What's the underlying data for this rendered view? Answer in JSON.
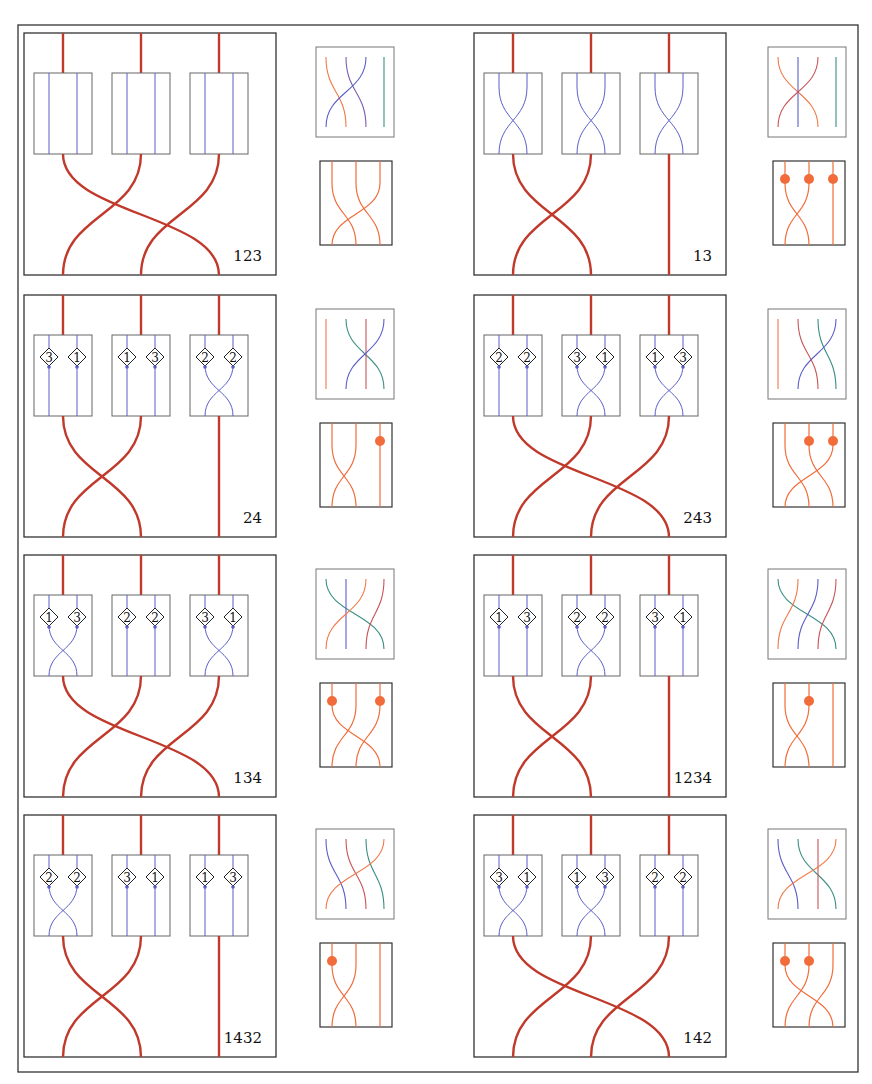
{
  "figure": {
    "width": 872,
    "height": 1084,
    "outer_frame": {
      "x": 18,
      "y": 25,
      "w": 840,
      "h": 1047
    },
    "colors": {
      "frame": "#333333",
      "thick_strand": "#c0392b",
      "blue_strand": "#5b5fc7",
      "orange_strand": "#f26b3a",
      "teal_strand": "#2e8b7a",
      "red_strand": "#d9534f",
      "dot": "#f26b3a",
      "box_border": "#555555"
    }
  },
  "panels": [
    {
      "label": "123",
      "col": 0,
      "row": 0,
      "top_perm": [
        [
          0,
          2
        ],
        [
          1,
          0
        ],
        [
          2,
          1
        ]
      ],
      "boxes": [
        {
          "type": "plain",
          "badges": null,
          "cross": false
        },
        {
          "type": "plain",
          "badges": null,
          "cross": false
        },
        {
          "type": "plain",
          "badges": null,
          "cross": false
        }
      ],
      "small_top": {
        "strands": [
          [
            "orange",
            0,
            1
          ],
          [
            "purple",
            1,
            2
          ],
          [
            "blue",
            2,
            0
          ],
          [
            "teal",
            3,
            3
          ]
        ]
      },
      "small_bottom": {
        "dots": [],
        "perm": [
          [
            0,
            1
          ],
          [
            1,
            2
          ],
          [
            2,
            0
          ]
        ]
      }
    },
    {
      "label": "13",
      "col": 1,
      "row": 0,
      "top_perm": [
        [
          0,
          1
        ],
        [
          1,
          0
        ],
        [
          2,
          2
        ]
      ],
      "boxes": [
        {
          "type": "cross",
          "badges": null
        },
        {
          "type": "cross",
          "badges": null
        },
        {
          "type": "cross",
          "badges": null
        }
      ],
      "small_top": {
        "strands": [
          [
            "orange",
            0,
            2
          ],
          [
            "blue",
            1,
            1
          ],
          [
            "red",
            2,
            0
          ],
          [
            "teal",
            3,
            3
          ]
        ]
      },
      "small_bottom": {
        "dots": [
          0,
          1,
          2
        ],
        "perm": [
          [
            0,
            1
          ],
          [
            1,
            0
          ],
          [
            2,
            2
          ]
        ]
      }
    },
    {
      "label": "24",
      "col": 0,
      "row": 1,
      "top_perm": [
        [
          0,
          1
        ],
        [
          1,
          0
        ],
        [
          2,
          2
        ]
      ],
      "boxes": [
        {
          "type": "plain",
          "badges": [
            "3",
            "1"
          ]
        },
        {
          "type": "plain",
          "badges": [
            "1",
            "3"
          ]
        },
        {
          "type": "cross",
          "badges": [
            "2",
            "2"
          ]
        }
      ],
      "small_top": {
        "strands": [
          [
            "orange",
            0,
            0
          ],
          [
            "teal",
            1,
            3
          ],
          [
            "red",
            2,
            2
          ],
          [
            "blue",
            3,
            1
          ]
        ]
      },
      "small_bottom": {
        "dots": [
          2
        ],
        "perm": [
          [
            0,
            1
          ],
          [
            1,
            0
          ],
          [
            2,
            2
          ]
        ]
      }
    },
    {
      "label": "243",
      "col": 1,
      "row": 1,
      "top_perm": [
        [
          0,
          2
        ],
        [
          1,
          0
        ],
        [
          2,
          1
        ]
      ],
      "boxes": [
        {
          "type": "plain",
          "badges": [
            "2",
            "2"
          ]
        },
        {
          "type": "cross",
          "badges": [
            "3",
            "1"
          ]
        },
        {
          "type": "cross",
          "badges": [
            "1",
            "3"
          ]
        }
      ],
      "small_top": {
        "strands": [
          [
            "orange",
            0,
            0
          ],
          [
            "red",
            1,
            2
          ],
          [
            "teal",
            2,
            3
          ],
          [
            "blue",
            3,
            1
          ]
        ]
      },
      "small_bottom": {
        "dots": [
          1,
          2
        ],
        "perm": [
          [
            0,
            1
          ],
          [
            1,
            2
          ],
          [
            2,
            0
          ]
        ]
      }
    },
    {
      "label": "134",
      "col": 0,
      "row": 2,
      "top_perm": [
        [
          0,
          2
        ],
        [
          1,
          0
        ],
        [
          2,
          1
        ]
      ],
      "boxes": [
        {
          "type": "cross",
          "badges": [
            "1",
            "3"
          ]
        },
        {
          "type": "plain",
          "badges": [
            "2",
            "2"
          ]
        },
        {
          "type": "cross",
          "badges": [
            "3",
            "1"
          ]
        }
      ],
      "small_top": {
        "strands": [
          [
            "teal",
            0,
            3
          ],
          [
            "blue",
            1,
            1
          ],
          [
            "orange",
            2,
            0
          ],
          [
            "red",
            3,
            2
          ]
        ]
      },
      "small_bottom": {
        "dots": [
          0,
          2
        ],
        "perm": [
          [
            0,
            2
          ],
          [
            1,
            0
          ],
          [
            2,
            1
          ]
        ]
      }
    },
    {
      "label": "1234",
      "col": 1,
      "row": 2,
      "top_perm": [
        [
          0,
          1
        ],
        [
          1,
          0
        ],
        [
          2,
          2
        ]
      ],
      "boxes": [
        {
          "type": "plain",
          "badges": [
            "1",
            "3"
          ]
        },
        {
          "type": "cross",
          "badges": [
            "2",
            "2"
          ]
        },
        {
          "type": "plain",
          "badges": [
            "3",
            "1"
          ]
        }
      ],
      "small_top": {
        "strands": [
          [
            "teal",
            0,
            3
          ],
          [
            "orange",
            1,
            0
          ],
          [
            "blue",
            2,
            1
          ],
          [
            "red",
            3,
            2
          ]
        ]
      },
      "small_bottom": {
        "dots": [
          1
        ],
        "perm": [
          [
            0,
            1
          ],
          [
            1,
            0
          ],
          [
            2,
            2
          ]
        ]
      }
    },
    {
      "label": "1432",
      "col": 0,
      "row": 3,
      "top_perm": [
        [
          0,
          1
        ],
        [
          1,
          0
        ],
        [
          2,
          2
        ]
      ],
      "boxes": [
        {
          "type": "cross",
          "badges": [
            "2",
            "2"
          ]
        },
        {
          "type": "plain",
          "badges": [
            "3",
            "1"
          ]
        },
        {
          "type": "plain",
          "badges": [
            "1",
            "3"
          ]
        }
      ],
      "small_top": {
        "strands": [
          [
            "blue",
            0,
            1
          ],
          [
            "red",
            1,
            2
          ],
          [
            "teal",
            2,
            3
          ],
          [
            "orange",
            3,
            0
          ]
        ]
      },
      "small_bottom": {
        "dots": [
          0
        ],
        "perm": [
          [
            0,
            1
          ],
          [
            1,
            0
          ],
          [
            2,
            2
          ]
        ]
      }
    },
    {
      "label": "142",
      "col": 1,
      "row": 3,
      "top_perm": [
        [
          0,
          2
        ],
        [
          1,
          0
        ],
        [
          2,
          1
        ]
      ],
      "boxes": [
        {
          "type": "cross",
          "badges": [
            "3",
            "1"
          ]
        },
        {
          "type": "cross",
          "badges": [
            "1",
            "3"
          ]
        },
        {
          "type": "plain",
          "badges": [
            "2",
            "2"
          ]
        }
      ],
      "small_top": {
        "strands": [
          [
            "blue",
            0,
            1
          ],
          [
            "teal",
            1,
            3
          ],
          [
            "red",
            2,
            2
          ],
          [
            "orange",
            3,
            0
          ]
        ]
      },
      "small_bottom": {
        "dots": [
          0,
          1
        ],
        "perm": [
          [
            0,
            2
          ],
          [
            1,
            0
          ],
          [
            2,
            1
          ]
        ]
      }
    }
  ]
}
